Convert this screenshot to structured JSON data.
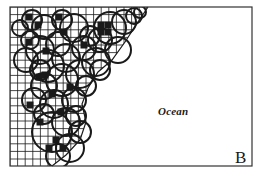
{
  "figure": {
    "panel_label": "B",
    "region_label": "Ocean",
    "frame": {
      "x": 10,
      "y": 7,
      "width": 242,
      "height": 159
    },
    "grid": {
      "cell_size": 7.6,
      "color": "#1a1a1a"
    },
    "coastline": [
      [
        10,
        7
      ],
      [
        148,
        7
      ],
      [
        138,
        22
      ],
      [
        125,
        42
      ],
      [
        112,
        60
      ],
      [
        98,
        72
      ],
      [
        88,
        88
      ],
      [
        82,
        104
      ],
      [
        86,
        122
      ],
      [
        80,
        140
      ],
      [
        66,
        155
      ],
      [
        52,
        166
      ],
      [
        10,
        166
      ]
    ],
    "filled_cells": [
      [
        29,
        17
      ],
      [
        38,
        25
      ],
      [
        59,
        17
      ],
      [
        64,
        32
      ],
      [
        101,
        25
      ],
      [
        108,
        25
      ],
      [
        101,
        32
      ],
      [
        108,
        32
      ],
      [
        84,
        45
      ],
      [
        46,
        51
      ],
      [
        29,
        42
      ],
      [
        39,
        77
      ],
      [
        52,
        94
      ],
      [
        70,
        87
      ],
      [
        61,
        112
      ],
      [
        56,
        140
      ],
      [
        63,
        148
      ],
      [
        49,
        148
      ],
      [
        40,
        122
      ],
      [
        30,
        105
      ],
      [
        45,
        75
      ]
    ],
    "circles": [
      [
        32,
        20,
        10
      ],
      [
        44,
        27,
        12
      ],
      [
        62,
        20,
        10
      ],
      [
        74,
        28,
        14
      ],
      [
        58,
        44,
        12
      ],
      [
        40,
        50,
        14
      ],
      [
        30,
        40,
        9
      ],
      [
        26,
        60,
        12
      ],
      [
        48,
        66,
        16
      ],
      [
        66,
        58,
        14
      ],
      [
        84,
        48,
        12
      ],
      [
        100,
        40,
        12
      ],
      [
        110,
        28,
        16
      ],
      [
        124,
        22,
        12
      ],
      [
        118,
        50,
        13
      ],
      [
        96,
        62,
        14
      ],
      [
        80,
        74,
        14
      ],
      [
        62,
        80,
        16
      ],
      [
        44,
        86,
        13
      ],
      [
        34,
        100,
        12
      ],
      [
        54,
        104,
        14
      ],
      [
        74,
        100,
        12
      ],
      [
        86,
        86,
        10
      ],
      [
        66,
        122,
        14
      ],
      [
        52,
        132,
        20
      ],
      [
        70,
        148,
        14
      ],
      [
        58,
        156,
        12
      ],
      [
        44,
        114,
        10
      ],
      [
        90,
        36,
        10
      ],
      [
        134,
        16,
        8
      ],
      [
        140,
        12,
        6
      ],
      [
        20,
        28,
        8
      ],
      [
        100,
        70,
        10
      ],
      [
        40,
        70,
        10
      ],
      [
        76,
        116,
        10
      ],
      [
        80,
        132,
        11
      ]
    ],
    "colors": {
      "ink": "#1a1a1a",
      "background": "#ffffff"
    }
  }
}
